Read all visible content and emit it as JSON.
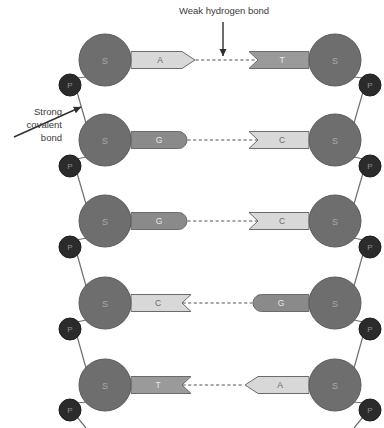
{
  "figure": {
    "background_color": "#ffffff"
  },
  "annotations": {
    "weak_bond": {
      "label": "Weak hydrogen bond",
      "text_x": 224,
      "text_y": 14,
      "arrow_x": 223,
      "arrow_y1": 22,
      "arrow_y2": 56,
      "color": "#3a3a3a"
    },
    "strong_bond": {
      "lines": [
        "Strong",
        "covalent",
        "bond"
      ],
      "text_x": 62,
      "text_y": 115,
      "line_height": 13,
      "arrow_x1": 14,
      "arrow_y1": 137,
      "arrow_x2": 81,
      "arrow_y2": 107,
      "color": "#3a3a3a"
    }
  },
  "colors": {
    "sugar_fill": "#6e6e6e",
    "sugar_stroke": "#5a5a5a",
    "sugar_label": "#a8a8a8",
    "phosphate_fill": "#2b2b2b",
    "phosphate_stroke": "#1f1f1f",
    "phosphate_label": "#8f8f8f",
    "backbone_line": "#6e6e6e",
    "hydrogen_bond": "#8c8c8c",
    "base_stroke": "#6b6b6b",
    "base_dark": "#8a8a8a",
    "base_medium": "#9a9a9a",
    "base_light": "#d8d8d8",
    "base_label_dark": "#e8e8e8",
    "base_label_light": "#6a6a6a",
    "connector": "#6e6e6e"
  },
  "geometry": {
    "left_sugar_x": 105,
    "right_sugar_x": 335,
    "sugar_radius": 26,
    "phosphate_radius": 11,
    "row_y": [
      60,
      140,
      221,
      303,
      385
    ],
    "left_phosphate_x": 70,
    "right_phosphate_x": 370,
    "phosphate_y": [
      85,
      166,
      247,
      329,
      410
    ],
    "midline_x": 223
  },
  "sugar_label": "S",
  "phosphate_label": "P",
  "rows": [
    {
      "index": 0,
      "left_base": {
        "letter": "A",
        "shade": "light",
        "end": "point-right",
        "x": 131,
        "width": 64
      },
      "right_base": {
        "letter": "T",
        "shade": "medium",
        "end": "notch-left",
        "x": 249,
        "width": 60
      }
    },
    {
      "index": 1,
      "left_base": {
        "letter": "G",
        "shade": "dark",
        "end": "round-right",
        "x": 131,
        "width": 56
      },
      "right_base": {
        "letter": "C",
        "shade": "light",
        "end": "notch-left",
        "x": 249,
        "width": 60
      }
    },
    {
      "index": 2,
      "left_base": {
        "letter": "G",
        "shade": "dark",
        "end": "round-right",
        "x": 131,
        "width": 56
      },
      "right_base": {
        "letter": "C",
        "shade": "light",
        "end": "notch-left",
        "x": 249,
        "width": 60
      }
    },
    {
      "index": 3,
      "left_base": {
        "letter": "C",
        "shade": "light",
        "end": "notch-right",
        "x": 131,
        "width": 60
      },
      "right_base": {
        "letter": "G",
        "shade": "dark",
        "end": "round-left",
        "x": 253,
        "width": 56
      }
    },
    {
      "index": 4,
      "left_base": {
        "letter": "T",
        "shade": "medium",
        "end": "notch-right",
        "x": 131,
        "width": 60
      },
      "right_base": {
        "letter": "A",
        "shade": "light",
        "end": "point-left",
        "x": 245,
        "width": 64
      }
    }
  ]
}
